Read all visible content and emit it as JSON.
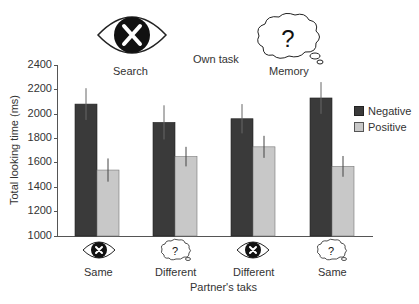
{
  "header": {
    "own_task_label": "Own task",
    "own_task_options": [
      {
        "label": "Search",
        "icon": "eye-x-icon"
      },
      {
        "label": "Memory",
        "icon": "thought-cloud-question-icon"
      }
    ]
  },
  "legend": {
    "items": [
      {
        "label": "Negative",
        "color": "#3a3a3a"
      },
      {
        "label": "Positive",
        "color": "#c8c8c8"
      }
    ]
  },
  "axes": {
    "ylabel": "Total looking time (ms)",
    "xlabel": "Partner's taks",
    "yticks": [
      "2400",
      "2200",
      "2000",
      "1800",
      "1600",
      "1400",
      "1200",
      "1000"
    ]
  },
  "groups": [
    {
      "label": "Same",
      "icon": "eye-x-icon"
    },
    {
      "label": "Different",
      "icon": "thought-cloud-question-icon"
    },
    {
      "label": "Different",
      "icon": "eye-x-icon"
    },
    {
      "label": "Same",
      "icon": "thought-cloud-question-icon"
    }
  ],
  "chart_data": {
    "type": "bar",
    "title": "",
    "xlabel": "Partner's taks",
    "ylabel": "Total looking time (ms)",
    "ylim": [
      1000,
      2400
    ],
    "yticks": [
      1000,
      1200,
      1400,
      1600,
      1800,
      2000,
      2200,
      2400
    ],
    "grid": false,
    "legend_position": "right",
    "categories": [
      "Same",
      "Different",
      "Different",
      "Same"
    ],
    "category_icons": [
      "eye-x-icon",
      "thought-cloud-question-icon",
      "eye-x-icon",
      "thought-cloud-question-icon"
    ],
    "own_task_groups": [
      {
        "label": "Search",
        "categories": [
          0,
          1
        ]
      },
      {
        "label": "Memory",
        "categories": [
          2,
          3
        ]
      }
    ],
    "series": [
      {
        "name": "Negative",
        "color": "#3a3a3a",
        "values": [
          2080,
          1930,
          1960,
          2130
        ],
        "error": [
          130,
          140,
          120,
          130
        ]
      },
      {
        "name": "Positive",
        "color": "#c8c8c8",
        "values": [
          1540,
          1650,
          1730,
          1570
        ],
        "error": [
          95,
          80,
          90,
          85
        ]
      }
    ],
    "annotations": [
      "Own task",
      "Search",
      "Memory"
    ]
  }
}
